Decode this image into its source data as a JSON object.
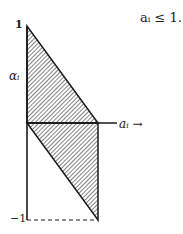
{
  "figure": {
    "constraint_text": "aᵢ ≤ 1.",
    "y_axis": {
      "label": "αᵢ",
      "tick_top": "1",
      "tick_bottom": "−1"
    },
    "x_axis": {
      "label": "aᵢ →"
    },
    "regions": [
      {
        "name": "upper-triangle",
        "vertices": [
          [
            0,
            1
          ],
          [
            0,
            0
          ],
          [
            1,
            0
          ]
        ],
        "fill": "hatched"
      },
      {
        "name": "lower-triangle",
        "vertices": [
          [
            0,
            0
          ],
          [
            1,
            0
          ],
          [
            1,
            -1
          ]
        ],
        "fill": "hatched"
      }
    ],
    "guide_line": {
      "from": [
        0,
        -1
      ],
      "to": [
        1,
        -1
      ],
      "style": "dashed"
    },
    "colors": {
      "ink": "#1a1a1a",
      "background": "#ffffff"
    }
  }
}
